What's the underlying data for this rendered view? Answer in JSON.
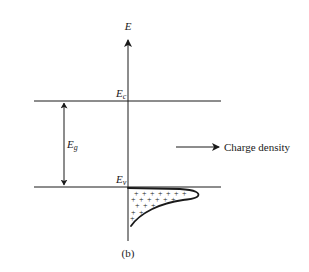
{
  "diagram": {
    "panel_label": "(b)",
    "axis": {
      "label": "E",
      "direction": "up"
    },
    "levels": [
      {
        "id": "conduction-band-edge",
        "label": "E",
        "subscript": "c",
        "y": 101
      },
      {
        "id": "valence-band-edge",
        "label": "E",
        "subscript": "v",
        "y": 187
      }
    ],
    "band_gap": {
      "label": "E",
      "subscript": "g"
    },
    "legend_arrow": {
      "label": "Charge density"
    },
    "charge_distribution": {
      "symbol": "+",
      "carrier": "holes",
      "location": "below valence band edge"
    },
    "colors": {
      "ink": "#1a1a1a",
      "background": "#ffffff"
    }
  }
}
